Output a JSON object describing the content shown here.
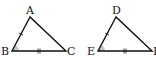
{
  "diagram": {
    "triangles": [
      {
        "name": "ABC",
        "vertices": {
          "A": [
            30,
            17
          ],
          "B": [
            12,
            51
          ],
          "C": [
            66,
            51
          ]
        },
        "labels": {
          "A": "A",
          "B": "B",
          "C": "C"
        },
        "marks": {
          "AB": "single-tick",
          "BC": "double-tick",
          "angle_B": "shaded-arc"
        }
      },
      {
        "name": "DEF",
        "vertices": {
          "D": [
            116,
            17
          ],
          "E": [
            98,
            51
          ],
          "F": [
            152,
            51
          ]
        },
        "labels": {
          "D": "D",
          "E": "E",
          "F": "F"
        },
        "marks": {
          "DE": "single-tick",
          "EF": "double-tick",
          "angle_E": "shaded-arc"
        }
      }
    ],
    "colors": {
      "stroke": "#111111",
      "arc_fill": "#c8c8c8"
    }
  }
}
